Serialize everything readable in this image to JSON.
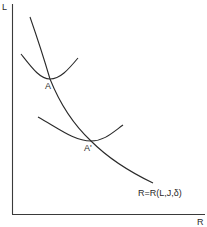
{
  "diagram": {
    "axes": {
      "y_label": "L",
      "x_label": "R"
    },
    "curves": {
      "main_curve_label": "R=R(L,J,δ)",
      "upper_isocurve_point": "A",
      "lower_isocurve_point": "A'"
    }
  }
}
